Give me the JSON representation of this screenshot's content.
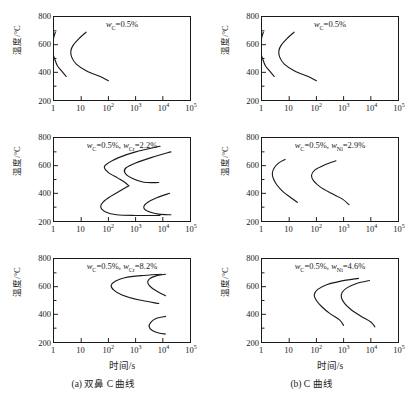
{
  "figure": {
    "background": "#ffffff",
    "line_color": "#1a1a1a",
    "axis_label_x": "时间/s",
    "axis_label_y": "温度/°C"
  },
  "columns": [
    {
      "id": "a",
      "caption": "(a) 双鼻 C 曲线",
      "xaxis_title": "时间/s"
    },
    {
      "id": "b",
      "caption": "(b) C 曲线",
      "xaxis_title": "时间/s"
    }
  ],
  "axes": {
    "y_ticks": [
      "800",
      "600",
      "400",
      "200"
    ],
    "y_values": [
      800,
      600,
      400,
      200
    ],
    "y_minor_values": [
      700,
      500,
      300
    ],
    "ylim": [
      200,
      800
    ],
    "ylabel": "温度/°C",
    "x_ticks": [
      "1",
      "10",
      "10²",
      "10³",
      "10⁴",
      "10⁵"
    ],
    "x_mantissas": [
      "1",
      "10",
      "10",
      "10",
      "10",
      "10"
    ],
    "x_exponents": [
      "",
      "",
      "2",
      "3",
      "4",
      "5"
    ],
    "x_values": [
      0,
      1,
      2,
      3,
      4,
      5
    ],
    "xlim_log10": [
      0,
      5
    ],
    "xlabel": "时间/s",
    "grid": false
  },
  "chart_data": [
    {
      "type": "line",
      "panel": "a1",
      "column": "a",
      "row": 1,
      "title": "",
      "annotation": "w_C=0.5%",
      "annotation_parts": {
        "symbol": "w",
        "subscript": "C",
        "text": "=0.5%"
      },
      "xlabel": "时间/s",
      "ylabel": "温度/°C",
      "ylim": [
        200,
        800
      ],
      "xlim_log10": [
        0,
        5
      ],
      "series": [
        {
          "name": "start-curve",
          "points_log10_t_vs_T": [
            [
              0.05,
              690
            ],
            [
              0.0,
              660
            ],
            [
              -0.04,
              620
            ],
            [
              -0.08,
              575
            ],
            [
              -0.05,
              540
            ],
            [
              0.02,
              500
            ],
            [
              0.12,
              450
            ],
            [
              0.28,
              410
            ],
            [
              0.45,
              370
            ]
          ]
        },
        {
          "name": "finish-curve",
          "points_log10_t_vs_T": [
            [
              1.18,
              690
            ],
            [
              0.95,
              650
            ],
            [
              0.72,
              600
            ],
            [
              0.62,
              555
            ],
            [
              0.65,
              510
            ],
            [
              0.82,
              460
            ],
            [
              1.2,
              410
            ],
            [
              1.7,
              370
            ],
            [
              2.0,
              340
            ]
          ]
        }
      ]
    },
    {
      "type": "line",
      "panel": "a2",
      "column": "a",
      "row": 2,
      "title": "",
      "annotation": "w_C=0.5%, w_Cr=2.2%",
      "annotation_parts": {
        "symbol1": "w",
        "subscript1": "C",
        "text1": "=0.5%,",
        "symbol2": "w",
        "subscript2": "Cr",
        "text2": "=2.2%"
      },
      "xlabel": "时间/s",
      "ylabel": "温度/°C",
      "ylim": [
        200,
        800
      ],
      "xlim_log10": [
        0,
        5
      ],
      "series": [
        {
          "name": "start-upper-nose",
          "points_log10_t_vs_T": [
            [
              3.9,
              740
            ],
            [
              3.0,
              700
            ],
            [
              2.4,
              660
            ],
            [
              2.0,
              620
            ],
            [
              1.85,
              590
            ],
            [
              2.0,
              550
            ],
            [
              2.35,
              510
            ],
            [
              2.6,
              480
            ],
            [
              2.75,
              455
            ]
          ]
        },
        {
          "name": "start-lower-nose",
          "points_log10_t_vs_T": [
            [
              2.75,
              455
            ],
            [
              2.45,
              420
            ],
            [
              2.1,
              380
            ],
            [
              1.82,
              340
            ],
            [
              1.72,
              300
            ],
            [
              1.9,
              265
            ],
            [
              2.3,
              245
            ],
            [
              3.0,
              240
            ],
            [
              3.9,
              240
            ]
          ]
        },
        {
          "name": "finish-upper-nose",
          "points_log10_t_vs_T": [
            [
              4.3,
              700
            ],
            [
              3.6,
              660
            ],
            [
              3.0,
              620
            ],
            [
              2.65,
              585
            ],
            [
              2.6,
              550
            ],
            [
              2.85,
              510
            ],
            [
              3.3,
              480
            ],
            [
              3.85,
              478
            ]
          ]
        },
        {
          "name": "finish-lower-nose",
          "points_log10_t_vs_T": [
            [
              4.25,
              400
            ],
            [
              3.8,
              370
            ],
            [
              3.45,
              335
            ],
            [
              3.3,
              300
            ],
            [
              3.45,
              270
            ],
            [
              3.85,
              250
            ],
            [
              4.3,
              245
            ]
          ]
        }
      ]
    },
    {
      "type": "line",
      "panel": "a3",
      "column": "a",
      "row": 3,
      "title": "",
      "annotation": "w_C=0.5%, w_Cr=8.2%",
      "annotation_parts": {
        "symbol1": "w",
        "subscript1": "C",
        "text1": "=0.5%,",
        "symbol2": "w",
        "subscript2": "Cr",
        "text2": "=8.2%"
      },
      "xlabel": "时间/s",
      "ylabel": "温度/°C",
      "ylim": [
        200,
        800
      ],
      "xlim_log10": [
        0,
        5
      ],
      "series": [
        {
          "name": "start-upper-nose",
          "points_log10_t_vs_T": [
            [
              3.95,
              690
            ],
            [
              3.2,
              680
            ],
            [
              2.6,
              665
            ],
            [
              2.25,
              640
            ],
            [
              2.1,
              610
            ],
            [
              2.2,
              575
            ],
            [
              2.5,
              540
            ],
            [
              3.1,
              505
            ],
            [
              3.85,
              478
            ]
          ]
        },
        {
          "name": "finish-upper-nose",
          "points_log10_t_vs_T": [
            [
              4.1,
              690
            ],
            [
              3.75,
              678
            ],
            [
              3.5,
              655
            ],
            [
              3.45,
              625
            ],
            [
              3.6,
              590
            ],
            [
              3.85,
              560
            ],
            [
              4.1,
              535
            ]
          ]
        },
        {
          "name": "lower-nose",
          "points_log10_t_vs_T": [
            [
              4.1,
              385
            ],
            [
              3.75,
              370
            ],
            [
              3.55,
              340
            ],
            [
              3.5,
              310
            ],
            [
              3.6,
              285
            ],
            [
              3.85,
              265
            ],
            [
              4.1,
              258
            ]
          ]
        }
      ]
    },
    {
      "type": "line",
      "panel": "b1",
      "column": "b",
      "row": 1,
      "title": "",
      "annotation": "w_C=0.5%",
      "annotation_parts": {
        "symbol": "w",
        "subscript": "C",
        "text": "=0.5%"
      },
      "xlabel": "时间/s",
      "ylabel": "温度/°C",
      "ylim": [
        200,
        800
      ],
      "xlim_log10": [
        0,
        5
      ],
      "series": [
        {
          "name": "start-curve",
          "points_log10_t_vs_T": [
            [
              0.05,
              690
            ],
            [
              0.0,
              660
            ],
            [
              -0.04,
              620
            ],
            [
              -0.08,
              575
            ],
            [
              -0.05,
              540
            ],
            [
              0.02,
              500
            ],
            [
              0.12,
              450
            ],
            [
              0.28,
              410
            ],
            [
              0.45,
              370
            ]
          ]
        },
        {
          "name": "finish-curve",
          "points_log10_t_vs_T": [
            [
              1.18,
              690
            ],
            [
              0.95,
              650
            ],
            [
              0.72,
              600
            ],
            [
              0.62,
              555
            ],
            [
              0.65,
              510
            ],
            [
              0.82,
              460
            ],
            [
              1.2,
              410
            ],
            [
              1.7,
              370
            ],
            [
              2.0,
              340
            ]
          ]
        }
      ]
    },
    {
      "type": "line",
      "panel": "b2",
      "column": "b",
      "row": 2,
      "title": "",
      "annotation": "w_C=0.5%, w_Ni=2.9%",
      "annotation_parts": {
        "symbol1": "w",
        "subscript1": "C",
        "text1": "=0.5%,",
        "symbol2": "w",
        "subscript2": "Ni",
        "text2": "=2.9%"
      },
      "xlabel": "时间/s",
      "ylabel": "温度/°C",
      "ylim": [
        200,
        800
      ],
      "xlim_log10": [
        0,
        5
      ],
      "series": [
        {
          "name": "start-curve",
          "points_log10_t_vs_T": [
            [
              0.85,
              645
            ],
            [
              0.62,
              620
            ],
            [
              0.45,
              585
            ],
            [
              0.38,
              545
            ],
            [
              0.42,
              505
            ],
            [
              0.55,
              460
            ],
            [
              0.78,
              410
            ],
            [
              1.05,
              370
            ],
            [
              1.3,
              335
            ]
          ]
        },
        {
          "name": "finish-curve",
          "points_log10_t_vs_T": [
            [
              2.72,
              635
            ],
            [
              2.3,
              605
            ],
            [
              1.95,
              570
            ],
            [
              1.82,
              530
            ],
            [
              1.9,
              490
            ],
            [
              2.15,
              445
            ],
            [
              2.55,
              400
            ],
            [
              2.95,
              360
            ],
            [
              3.2,
              318
            ]
          ]
        }
      ]
    },
    {
      "type": "line",
      "panel": "b3",
      "column": "b",
      "row": 3,
      "title": "",
      "annotation": "w_C=0.5%, w_Ni=4.6%",
      "annotation_parts": {
        "symbol1": "w",
        "subscript1": "C",
        "text1": "=0.5%,",
        "symbol2": "w",
        "subscript2": "Ni",
        "text2": "=4.6%"
      },
      "xlabel": "时间/s",
      "ylabel": "温度/°C",
      "ylim": [
        200,
        800
      ],
      "xlim_log10": [
        0,
        5
      ],
      "series": [
        {
          "name": "start-curve",
          "points_log10_t_vs_T": [
            [
              3.55,
              660
            ],
            [
              2.9,
              640
            ],
            [
              2.4,
              615
            ],
            [
              2.05,
              580
            ],
            [
              1.92,
              540
            ],
            [
              2.0,
              500
            ],
            [
              2.2,
              455
            ],
            [
              2.5,
              405
            ],
            [
              2.85,
              360
            ],
            [
              3.0,
              320
            ]
          ]
        },
        {
          "name": "finish-curve",
          "points_log10_t_vs_T": [
            [
              3.95,
              645
            ],
            [
              3.5,
              625
            ],
            [
              3.15,
              595
            ],
            [
              2.95,
              560
            ],
            [
              2.92,
              520
            ],
            [
              3.05,
              475
            ],
            [
              3.3,
              430
            ],
            [
              3.65,
              385
            ],
            [
              4.0,
              345
            ],
            [
              4.15,
              310
            ]
          ]
        }
      ]
    }
  ]
}
